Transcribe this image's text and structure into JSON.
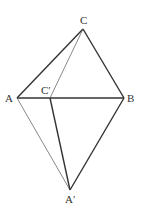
{
  "diagram": {
    "type": "geometry-figure",
    "points": {
      "C": {
        "label": "C",
        "x": 83,
        "y": 29
      },
      "A": {
        "label": "A",
        "x": 17,
        "y": 98
      },
      "Cp": {
        "label": "C′",
        "x": 50,
        "y": 98
      },
      "B": {
        "label": "B",
        "x": 124,
        "y": 98
      },
      "Ap": {
        "label": "A′",
        "x": 70,
        "y": 190
      }
    },
    "segments": [
      {
        "from": "A",
        "to": "C",
        "style": "thick"
      },
      {
        "from": "C",
        "to": "B",
        "style": "thick"
      },
      {
        "from": "A",
        "to": "B",
        "style": "thick"
      },
      {
        "from": "B",
        "to": "Ap",
        "style": "thick"
      },
      {
        "from": "Cp",
        "to": "Ap",
        "style": "thick"
      },
      {
        "from": "C",
        "to": "Cp",
        "style": "thin"
      },
      {
        "from": "A",
        "to": "Ap",
        "style": "thin"
      }
    ],
    "colors": {
      "line": "#333333",
      "thin_line": "#555555",
      "background": "#ffffff"
    }
  }
}
